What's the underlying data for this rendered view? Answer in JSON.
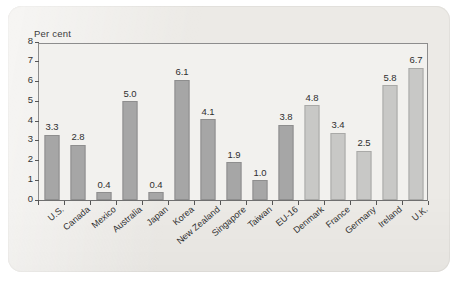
{
  "chart_data": {
    "type": "bar",
    "title": "",
    "subtitle": "",
    "xlabel": "",
    "ylabel": "Per cent",
    "ylim": [
      0,
      8
    ],
    "ytick_values": [
      0,
      1,
      2,
      3,
      4,
      5,
      6,
      7,
      8
    ],
    "ytick_labels": [
      "0",
      "1",
      "2",
      "3",
      "4",
      "5",
      "6",
      "7",
      "8"
    ],
    "grid": false,
    "legend": "none",
    "categories": [
      "U.S.",
      "Canada",
      "Mexico",
      "Australia",
      "Japan",
      "Korea",
      "New Zealand",
      "Singapore",
      "Taiwan",
      "EU-16",
      "Denmark",
      "France",
      "Germany",
      "Ireland",
      "U.K."
    ],
    "values": [
      3.3,
      2.8,
      0.4,
      5.0,
      0.4,
      6.1,
      4.1,
      1.9,
      1.0,
      3.8,
      4.8,
      3.4,
      2.5,
      5.8,
      6.7
    ],
    "value_labels": [
      "3.3",
      "2.8",
      "0.4",
      "5.0",
      "0.4",
      "6.1",
      "4.1",
      "1.9",
      "1.0",
      "3.8",
      "4.8",
      "3.4",
      "2.5",
      "5.8",
      "6.7"
    ],
    "groups": [
      "a",
      "a",
      "a",
      "a",
      "a",
      "a",
      "a",
      "a",
      "a",
      "a",
      "b",
      "b",
      "b",
      "b",
      "b"
    ],
    "colors": {
      "bar_group_a": "#a6a6a6",
      "bar_group_b": "#c8c8c6",
      "plot_background": "#f2f1ee",
      "card_background": "#eceae6",
      "axis": "#8d8d8d",
      "text": "#2f2f2f"
    }
  }
}
